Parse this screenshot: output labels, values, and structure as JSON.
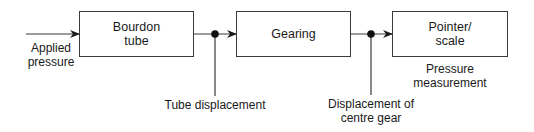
{
  "diagram": {
    "input": {
      "label": "Applied\npressure"
    },
    "blocks": [
      {
        "id": "bourdon-tube",
        "label": "Bourdon\ntube"
      },
      {
        "id": "gearing",
        "label": "Gearing"
      },
      {
        "id": "pointer-scale",
        "label": "Pointer/\nscale"
      }
    ],
    "signals": [
      {
        "id": "tube-displacement",
        "label": "Tube displacement"
      },
      {
        "id": "centre-gear-displacement",
        "label": "Displacement of\ncentre gear"
      }
    ],
    "output": {
      "label": "Pressure\nmeasurement"
    },
    "colors": {
      "line": "#3a3a3a",
      "node": "#111111",
      "text": "#1a1a1a",
      "background": "#ffffff"
    }
  }
}
